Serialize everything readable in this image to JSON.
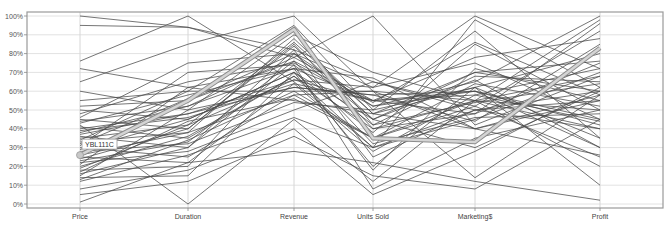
{
  "chart_data": {
    "type": "parallel-coordinates",
    "title": "",
    "axes": [
      "Price",
      "Duration",
      "Revenue",
      "Units Sold",
      "Marketing$",
      "Profit"
    ],
    "yticks": [
      "0%",
      "10%",
      "20%",
      "30%",
      "40%",
      "50%",
      "60%",
      "70%",
      "80%",
      "90%",
      "100%"
    ],
    "ylim": [
      0,
      100
    ],
    "grid": true,
    "highlight": {
      "name": "YBL111C",
      "values": [
        26,
        55,
        93,
        35,
        33,
        83
      ]
    },
    "series": [
      {
        "values": [
          100,
          94,
          78,
          55,
          60,
          45
        ]
      },
      {
        "values": [
          95,
          94,
          82,
          65,
          50,
          60
        ]
      },
      {
        "values": [
          76,
          100,
          65,
          30,
          45,
          70
        ]
      },
      {
        "values": [
          72,
          62,
          55,
          48,
          62,
          35
        ]
      },
      {
        "values": [
          65,
          85,
          100,
          60,
          40,
          55
        ]
      },
      {
        "values": [
          60,
          50,
          90,
          70,
          55,
          98
        ]
      },
      {
        "values": [
          52,
          55,
          80,
          45,
          70,
          60
        ]
      },
      {
        "values": [
          50,
          45,
          70,
          38,
          85,
          50
        ]
      },
      {
        "values": [
          48,
          65,
          75,
          52,
          65,
          100
        ]
      },
      {
        "values": [
          45,
          40,
          85,
          40,
          55,
          40
        ]
      },
      {
        "values": [
          43,
          58,
          72,
          55,
          48,
          75
        ]
      },
      {
        "values": [
          41,
          35,
          68,
          30,
          98,
          62
        ]
      },
      {
        "values": [
          40,
          48,
          62,
          58,
          60,
          30
        ]
      },
      {
        "values": [
          38,
          52,
          78,
          100,
          42,
          68
        ]
      },
      {
        "values": [
          36,
          30,
          82,
          25,
          50,
          55
        ]
      },
      {
        "values": [
          35,
          42,
          66,
          62,
          75,
          45
        ]
      },
      {
        "values": [
          34,
          60,
          60,
          35,
          52,
          92
        ]
      },
      {
        "values": [
          33,
          38,
          88,
          48,
          40,
          58
        ]
      },
      {
        "values": [
          31,
          70,
          74,
          42,
          68,
          65
        ]
      },
      {
        "values": [
          30,
          25,
          58,
          60,
          55,
          50
        ]
      },
      {
        "values": [
          29,
          45,
          70,
          20,
          62,
          80
        ]
      },
      {
        "values": [
          28,
          32,
          54,
          50,
          92,
          35
        ]
      },
      {
        "values": [
          27,
          55,
          76,
          32,
          46,
          48
        ]
      },
      {
        "values": [
          25,
          22,
          64,
          55,
          58,
          72
        ]
      },
      {
        "values": [
          24,
          40,
          84,
          45,
          30,
          60
        ]
      },
      {
        "values": [
          22,
          28,
          50,
          65,
          52,
          25
        ]
      },
      {
        "values": [
          21,
          62,
          72,
          18,
          72,
          55
        ]
      },
      {
        "values": [
          20,
          36,
          68,
          40,
          48,
          96
        ]
      },
      {
        "values": [
          18,
          20,
          80,
          52,
          60,
          42
        ]
      },
      {
        "values": [
          17,
          44,
          56,
          35,
          55,
          68
        ]
      },
      {
        "values": [
          16,
          30,
          74,
          8,
          35,
          50
        ]
      },
      {
        "values": [
          15,
          50,
          62,
          58,
          44,
          85
        ]
      },
      {
        "values": [
          14,
          15,
          70,
          45,
          66,
          30
        ]
      },
      {
        "values": [
          13,
          34,
          60,
          60,
          14,
          58
        ]
      },
      {
        "values": [
          12,
          26,
          46,
          30,
          50,
          40
        ]
      },
      {
        "values": [
          8,
          18,
          40,
          5,
          28,
          62
        ]
      },
      {
        "values": [
          5,
          12,
          36,
          15,
          8,
          45
        ]
      },
      {
        "values": [
          1,
          22,
          28,
          22,
          12,
          2
        ]
      },
      {
        "values": [
          42,
          0,
          45,
          12,
          55,
          20
        ]
      },
      {
        "values": [
          55,
          60,
          95,
          50,
          62,
          10
        ]
      },
      {
        "values": [
          46,
          75,
          80,
          62,
          100,
          72
        ]
      },
      {
        "values": [
          37,
          48,
          66,
          55,
          78,
          88
        ]
      },
      {
        "values": [
          32,
          56,
          92,
          42,
          54,
          64
        ]
      },
      {
        "values": [
          26,
          38,
          58,
          35,
          64,
          52
        ]
      },
      {
        "values": [
          19,
          42,
          86,
          48,
          70,
          76
        ]
      },
      {
        "values": [
          44,
          52,
          72,
          67,
          40,
          26
        ]
      },
      {
        "values": [
          39,
          46,
          64,
          28,
          58,
          44
        ]
      },
      {
        "values": [
          23,
          33,
          76,
          54,
          86,
          58
        ]
      }
    ]
  },
  "layout": {
    "plot_left": 27,
    "plot_right": 663,
    "plot_top": 12,
    "plot_bottom": 208,
    "y0": 204,
    "y100": 16,
    "axis_x": [
      80,
      188,
      294,
      373,
      475,
      600
    ],
    "line_color": "#4a4a4a",
    "highlight_color": "#b8b8b8",
    "grid_color": "#e2e2e2",
    "frame_color": "#9a9a9a"
  }
}
